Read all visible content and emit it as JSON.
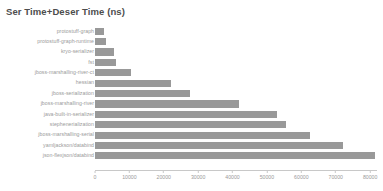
{
  "chart_data": {
    "type": "bar",
    "orientation": "horizontal",
    "title": "Ser Time+Deser Time (ns)",
    "xlabel": "",
    "ylabel": "",
    "xlim": [
      0,
      82000
    ],
    "grid": false,
    "legend": null,
    "bar_color": "#999999",
    "axis_color": "#c8c8c8",
    "label_color": "#9a9a9a",
    "title_color": "#4d4d4d",
    "xticks": [
      0,
      10000,
      20000,
      30000,
      40000,
      50000,
      60000,
      70000,
      80000
    ],
    "xtick_labels": [
      "0",
      "10000",
      "20000",
      "30000",
      "40000",
      "50000",
      "60000",
      "70000",
      "80000"
    ],
    "categories": [
      "protostuff-graph",
      "protostuff-graph-runtime",
      "kryo-serializer",
      "fst",
      "jboss-marshalling-river-ct",
      "hessian",
      "jboss-serialization",
      "jboss-marshalling-river",
      "java-built-in-serializer",
      "stephenerialization",
      "jboss-marshalling-serial",
      "yamljackson/databind",
      "json-flexjson/databind"
    ],
    "values": [
      2500,
      3100,
      5500,
      6000,
      10500,
      22000,
      27500,
      42000,
      53000,
      55500,
      62500,
      72000,
      81500
    ]
  }
}
